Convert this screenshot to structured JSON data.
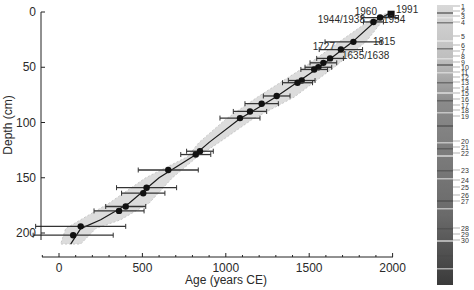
{
  "chart_data": {
    "type": "scatter",
    "title": "",
    "xlabel": "Age (years CE)",
    "ylabel": "Depth (cm)",
    "xlim": [
      -100,
      2000
    ],
    "ylim": [
      215,
      0
    ],
    "y_inverted": true,
    "grid": false,
    "x_ticks": [
      0,
      500,
      1000,
      1500,
      2000
    ],
    "y_ticks": [
      0,
      50,
      100,
      150,
      200
    ],
    "series": [
      {
        "name": "dated levels",
        "style": "black circles with horizontal error bars",
        "points": [
          {
            "age": 1991,
            "depth": 2,
            "err": 10,
            "marker": "square"
          },
          {
            "age": 1925,
            "depth": 5,
            "err": 110
          },
          {
            "age": 1885,
            "depth": 9,
            "err": 60
          },
          {
            "age": 1765,
            "depth": 27,
            "err": 170
          },
          {
            "age": 1690,
            "depth": 34,
            "err": 130
          },
          {
            "age": 1625,
            "depth": 42,
            "err": 80
          },
          {
            "age": 1585,
            "depth": 46,
            "err": 80
          },
          {
            "age": 1555,
            "depth": 50,
            "err": 80
          },
          {
            "age": 1530,
            "depth": 52,
            "err": 80
          },
          {
            "age": 1455,
            "depth": 62,
            "err": 80
          },
          {
            "age": 1430,
            "depth": 64,
            "err": 90
          },
          {
            "age": 1305,
            "depth": 76,
            "err": 80
          },
          {
            "age": 1215,
            "depth": 83,
            "err": 100
          },
          {
            "age": 1145,
            "depth": 90,
            "err": 100
          },
          {
            "age": 1085,
            "depth": 96,
            "err": 120
          },
          {
            "age": 845,
            "depth": 126,
            "err": 80
          },
          {
            "age": 820,
            "depth": 129,
            "err": 90
          },
          {
            "age": 655,
            "depth": 143,
            "err": 180
          },
          {
            "age": 525,
            "depth": 159,
            "err": 180
          },
          {
            "age": 505,
            "depth": 164,
            "err": 130
          },
          {
            "age": 400,
            "depth": 176,
            "err": 120
          },
          {
            "age": 360,
            "depth": 180,
            "err": 150
          },
          {
            "age": 130,
            "depth": 194,
            "err": 270
          },
          {
            "age": 85,
            "depth": 202,
            "err": 240
          }
        ]
      },
      {
        "name": "age-depth model",
        "style": "black line with grey confidence envelope",
        "points": [
          {
            "age": 1995,
            "depth": 0
          },
          {
            "age": 1900,
            "depth": 8
          },
          {
            "age": 1760,
            "depth": 27
          },
          {
            "age": 1560,
            "depth": 50
          },
          {
            "age": 1300,
            "depth": 77
          },
          {
            "age": 1080,
            "depth": 97
          },
          {
            "age": 900,
            "depth": 118
          },
          {
            "age": 800,
            "depth": 131
          },
          {
            "age": 600,
            "depth": 150
          },
          {
            "age": 420,
            "depth": 173
          },
          {
            "age": 250,
            "depth": 188
          },
          {
            "age": 130,
            "depth": 196
          },
          {
            "age": 70,
            "depth": 210
          }
        ]
      }
    ],
    "annotations": [
      {
        "text": "1991",
        "age": 1991,
        "depth": 2
      },
      {
        "text": "1960",
        "age": 1935,
        "depth": 5
      },
      {
        "text": "1954",
        "age": 1925,
        "depth": 8
      },
      {
        "text": "1944/1938",
        "age": 1880,
        "depth": 10
      },
      {
        "text": "1815",
        "age": 1765,
        "depth": 27
      },
      {
        "text": "1727",
        "age": 1690,
        "depth": 34
      },
      {
        "text": "1635/1638",
        "age": 1625,
        "depth": 42
      }
    ],
    "core_image_labels": [
      "1",
      "2",
      "3",
      "4",
      "5",
      "6",
      "7",
      "8",
      "9",
      "10",
      "11",
      "12",
      "13",
      "14",
      "15",
      "16",
      "17",
      "18",
      "19",
      "20",
      "21",
      "22",
      "23",
      "24",
      "25",
      "26",
      "27",
      "28",
      "29",
      "30"
    ]
  },
  "axes": {
    "x_tick_labels": [
      "0",
      "500",
      "1000",
      "1500",
      "2000"
    ],
    "y_tick_labels": [
      "0",
      "50",
      "100",
      "150",
      "200"
    ],
    "x_title": "Age (years CE)",
    "y_title": "Depth (cm)"
  },
  "colors": {
    "envelope": "#dcdcdc",
    "line": "#1a1a1a",
    "marker": "#111111"
  }
}
